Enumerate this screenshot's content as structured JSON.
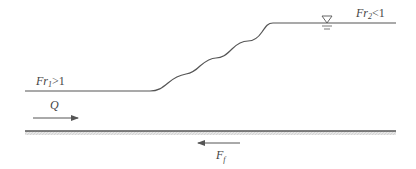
{
  "diagram": {
    "type": "undular hydraulic jump schematic",
    "labels": {
      "upstream_froude": "Fr",
      "upstream_froude_sub": "1",
      "upstream_froude_rel": ">1",
      "downstream_froude": "Fr",
      "downstream_froude_sub": "2",
      "downstream_froude_rel": "<1",
      "discharge": "Q",
      "friction_force": "F",
      "friction_force_sub": "f"
    },
    "symbols": {
      "water_surface_marker": "inverted-triangle-icon"
    },
    "colors": {
      "line": "#555555",
      "bed_hatch": "#bbbbbb",
      "text": "#444444"
    }
  }
}
